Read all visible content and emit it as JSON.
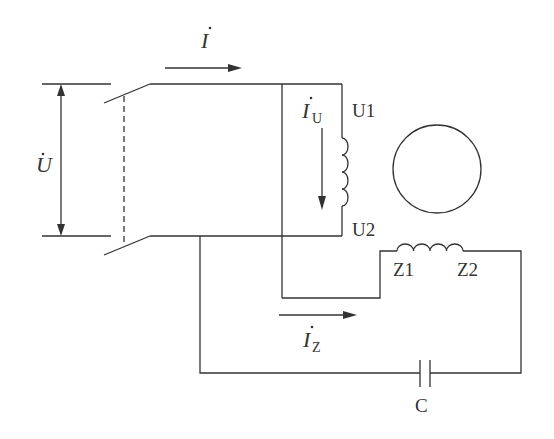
{
  "diagram": {
    "type": "single-phase capacitor motor wiring",
    "labels": {
      "voltage": "U",
      "current_total": "I",
      "current_main": "I",
      "current_main_sub": "U",
      "current_aux": "I",
      "current_aux_sub": "Z",
      "main_winding_start": "U1",
      "main_winding_end": "U2",
      "aux_winding_start": "Z1",
      "aux_winding_end": "Z2",
      "capacitor": "C"
    },
    "components": [
      {
        "name": "double-pole switch"
      },
      {
        "name": "main winding",
        "terminals": [
          "U1",
          "U2"
        ]
      },
      {
        "name": "rotor"
      },
      {
        "name": "auxiliary winding",
        "terminals": [
          "Z1",
          "Z2"
        ]
      },
      {
        "name": "capacitor",
        "label": "C"
      }
    ]
  }
}
